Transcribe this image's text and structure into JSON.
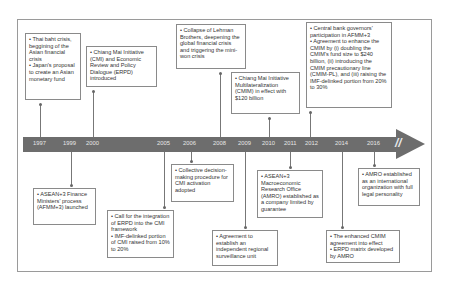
{
  "timeline": {
    "years": [
      "1997",
      "1999",
      "2000",
      "2005",
      "2006",
      "2008",
      "2009",
      "2010",
      "2011",
      "2012",
      "2014",
      "2016"
    ],
    "break_marker": "//"
  },
  "events_above": [
    {
      "year": "1997",
      "lines": [
        "• Thai baht crisis, beggining of the Asian financial crisis",
        "• Japan's proposal to create an Asian monetary fund"
      ]
    },
    {
      "year": "2000",
      "lines": [
        "• Chiang Mai Initiative (CMI) and Economic Review and Policy Dialogue (ERPD) introduced"
      ]
    },
    {
      "year": "2008",
      "lines": [
        "• Collapse of Lehman Brothers, deepening the global financial crisis and triggering the mini-won crisis"
      ]
    },
    {
      "year": "2010",
      "lines": [
        "• Chiang Mai Initiative Multilateralization (CMIM) in effect with $120 billion"
      ]
    },
    {
      "year": "2012",
      "lines": [
        "• Central bank governors' participation in AFMM+3",
        "• Agreement to enhance the CMIM by (i) doubling the CMIM's fund size to $240 billion, (ii) introducing the CMIM precautionary line (CMIM-PL), and (iii) raising the IMF-delinked portion from 20% to 30%"
      ]
    }
  ],
  "events_below": [
    {
      "year": "1999",
      "lines": [
        "• ASEAN+3 Finance Ministers' process (AFMM+3) launched"
      ]
    },
    {
      "year": "2005",
      "lines": [
        "• Call for the integration of ERPD into the CMI framework",
        "• IMF-delinked portion of CMI raised from 10% to 20%"
      ]
    },
    {
      "year": "2006",
      "lines": [
        "• Collective decision-making procedure for CMI activation adopted"
      ]
    },
    {
      "year": "2009",
      "lines": [
        "• Agreement to establish an independent regional surveillance unit"
      ]
    },
    {
      "year": "2011",
      "lines": [
        "• ASEAN+3 Macroeconomic Research Office (AMRO) established as a company limited by guarantee"
      ]
    },
    {
      "year": "2014",
      "lines": [
        "• The enhanced CMIM agreement into effect",
        "• ERPD matrix developed by AMRO"
      ]
    },
    {
      "year": "2016",
      "lines": [
        "• AMRO established as an international organization with full legal personality"
      ]
    }
  ],
  "colors": {
    "bar": "#6d6d6d",
    "year_text": "#e6e6e6",
    "box_border": "#8a8a8a",
    "connector": "#777777"
  }
}
